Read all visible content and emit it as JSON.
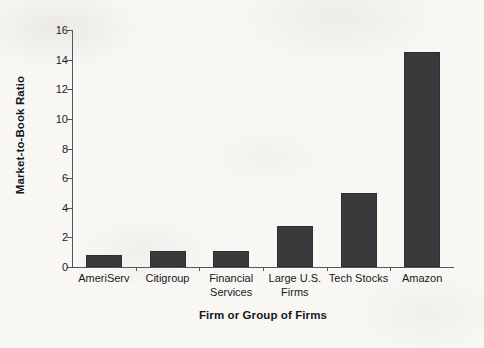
{
  "chart_data": {
    "type": "bar",
    "title": "",
    "xlabel": "Firm or Group of Firms",
    "ylabel": "Market-to-Book Ratio",
    "categories": [
      "AmeriServ",
      "Citigroup",
      "Financial\nServices",
      "Large U.S.\nFirms",
      "Tech Stocks",
      "Amazon"
    ],
    "values": [
      0.8,
      1.1,
      1.1,
      2.8,
      5.0,
      14.5
    ],
    "ylim": [
      0,
      16
    ],
    "yticks": [
      0,
      2,
      4,
      6,
      8,
      10,
      12,
      14,
      16
    ],
    "ytick_labels": [
      "0",
      "2",
      "4",
      "6",
      "8",
      "10",
      "12",
      "14",
      "16"
    ],
    "grid": false,
    "legend": null,
    "bar_color": "#3a3a3c",
    "background_color": "#f8f7f4",
    "axis_color": "#55555a",
    "text_color": "#17171a"
  }
}
